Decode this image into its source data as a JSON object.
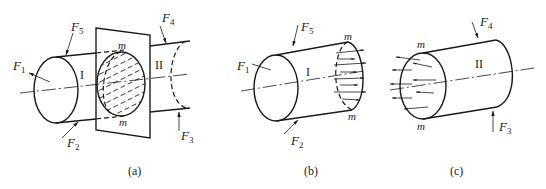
{
  "figure": {
    "panels": [
      {
        "id": "a",
        "caption": "(a)",
        "section_label_top": "m",
        "section_label_bottom": "m",
        "part_labels": [
          "I",
          "II"
        ],
        "forces": [
          {
            "name": "F",
            "sub": "1"
          },
          {
            "name": "F",
            "sub": "2"
          },
          {
            "name": "F",
            "sub": "3"
          },
          {
            "name": "F",
            "sub": "4"
          },
          {
            "name": "F",
            "sub": "5"
          }
        ]
      },
      {
        "id": "b",
        "caption": "(b)",
        "section_label_top": "m",
        "section_label_bottom": "m",
        "part_labels": [
          "I"
        ],
        "forces": [
          {
            "name": "F",
            "sub": "1"
          },
          {
            "name": "F",
            "sub": "2"
          },
          {
            "name": "F",
            "sub": "5"
          }
        ]
      },
      {
        "id": "c",
        "caption": "(c)",
        "section_label_top": "m",
        "section_label_bottom": "m",
        "part_labels": [
          "II"
        ],
        "forces": [
          {
            "name": "F",
            "sub": "3"
          },
          {
            "name": "F",
            "sub": "4"
          }
        ]
      }
    ]
  }
}
